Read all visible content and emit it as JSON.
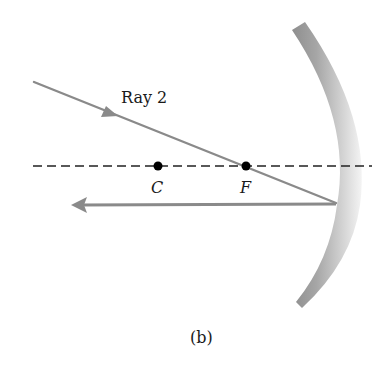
{
  "figure": {
    "caption": "(b)",
    "colors": {
      "ray": "#8a8a8a",
      "axis": "#222222",
      "point": "#000000",
      "mirror_dark": "#8c8c8c",
      "mirror_light": "#f2f2f2",
      "background": "#ffffff"
    }
  },
  "rays": {
    "incident": {
      "label": "Ray 2",
      "x1": 34,
      "y1": 82,
      "x2": 336,
      "y2": 203
    },
    "reflected": {
      "x1": 336,
      "y1": 204,
      "x2": 72,
      "y2": 205
    }
  },
  "axis": {
    "x1": 33,
    "x2": 372,
    "y": 166,
    "style": "dashed"
  },
  "points": [
    {
      "name": "C",
      "label": "C",
      "x": 158,
      "y": 166
    },
    {
      "name": "F",
      "label": "F",
      "x": 246,
      "y": 166
    }
  ],
  "mirror": {
    "type": "concave",
    "top": [
      292,
      28
    ],
    "vertex_x": 340,
    "bottom": [
      296,
      302
    ]
  }
}
